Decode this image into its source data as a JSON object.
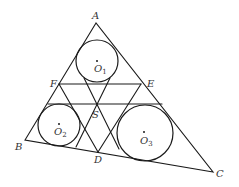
{
  "diagram": {
    "points": {
      "A": {
        "label": "A",
        "x": 96,
        "y": 23
      },
      "B": {
        "label": "B",
        "x": 25,
        "y": 140
      },
      "C": {
        "label": "C",
        "x": 213,
        "y": 172
      },
      "D": {
        "label": "D",
        "x": 98,
        "y": 152
      },
      "E": {
        "label": "E",
        "x": 141,
        "y": 84
      },
      "F": {
        "label": "F",
        "x": 59,
        "y": 84
      },
      "S": {
        "label": "S",
        "x": 97,
        "y": 104
      }
    },
    "circles": [
      {
        "name": "O",
        "sub": "1",
        "cx": 97,
        "cy": 61,
        "r": 21
      },
      {
        "name": "O",
        "sub": "2",
        "cx": 59,
        "cy": 125,
        "r": 21
      },
      {
        "name": "O",
        "sub": "3",
        "cx": 145,
        "cy": 133,
        "r": 28
      }
    ],
    "segments": [
      [
        "A",
        "B"
      ],
      [
        "B",
        "C"
      ],
      [
        "C",
        "A"
      ],
      [
        "F",
        "E"
      ],
      [
        "F",
        "D"
      ],
      [
        "E",
        "D"
      ],
      [
        "tangent-top-O2-O3"
      ],
      [
        "tangent-O1-left-through-S"
      ],
      [
        "tangent-O1-right-through-S"
      ]
    ],
    "colors": {
      "stroke": "#1a1a1a",
      "label": "#333333",
      "background": "#ffffff"
    }
  }
}
